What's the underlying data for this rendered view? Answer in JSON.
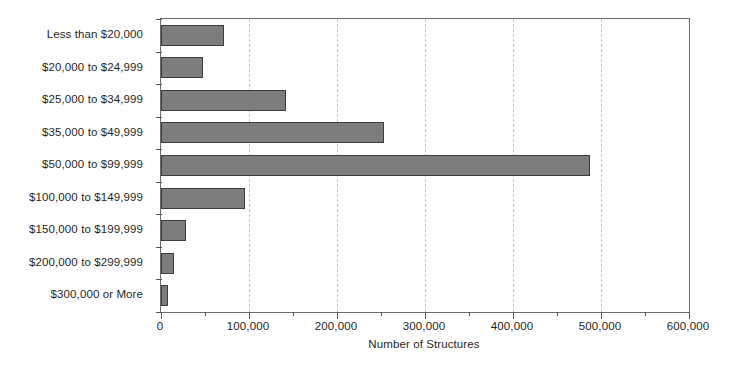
{
  "chart_data": {
    "type": "bar",
    "orientation": "horizontal",
    "title": "",
    "xlabel": "Number of Structures",
    "ylabel": "",
    "xlim": [
      0,
      600000
    ],
    "ylim": null,
    "grid": "vertical-dashed-major",
    "legend": "none",
    "categories": [
      "Less than $20,000",
      "$20,000 to $24,999",
      "$25,000 to $34,999",
      "$35,000 to $49,999",
      "$50,000 to $99,999",
      "$100,000 to $149,999",
      "$150,000 to $199,999",
      "$200,000 to $299,999",
      "$300,000 or More"
    ],
    "values": [
      72000,
      48000,
      142000,
      253000,
      488000,
      95000,
      28000,
      15000,
      8000
    ],
    "xticks": [
      0,
      100000,
      200000,
      300000,
      400000,
      500000,
      600000
    ],
    "xtick_labels": [
      "0",
      "100,000",
      "200,000",
      "300,000",
      "400,000",
      "500,000",
      "600,000"
    ],
    "xminor_ticks": [
      50000,
      150000,
      250000,
      350000,
      450000,
      550000
    ],
    "colors": {
      "bar_fill": "#7d7d7d",
      "bar_border": "#3d3d3d",
      "gridline": "#c2c2c2",
      "axis": "#6b6b6b",
      "text": "#1f1f1f",
      "background": "#ffffff"
    }
  }
}
